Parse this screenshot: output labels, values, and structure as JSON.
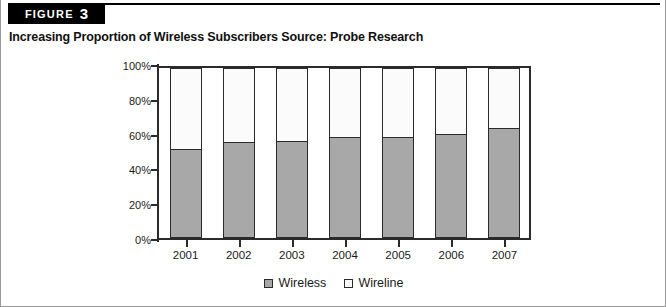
{
  "figure": {
    "banner_label": "FIGURE",
    "banner_number": "3",
    "title": "Increasing Proportion of Wireless Subscribers Source: Probe Research"
  },
  "legend": {
    "items": [
      {
        "label": "Wireless",
        "color": "#a8a8a8"
      },
      {
        "label": "Wireline",
        "color": "#fbfbfb"
      }
    ]
  },
  "axis": {
    "y_ticks": [
      "0%",
      "20%",
      "40%",
      "60%",
      "80%",
      "100%"
    ]
  },
  "chart_data": {
    "type": "bar",
    "stacked": true,
    "stack_total": 100,
    "title": "Increasing Proportion of Wireless Subscribers Source: Probe Research",
    "xlabel": "",
    "ylabel": "",
    "ylim": [
      0,
      100
    ],
    "ytick_values": [
      0,
      20,
      40,
      60,
      80,
      100
    ],
    "ytick_labels": [
      "0%",
      "20%",
      "40%",
      "60%",
      "80%",
      "100%"
    ],
    "grid": false,
    "legend_position": "bottom",
    "categories": [
      "2001",
      "2002",
      "2003",
      "2004",
      "2005",
      "2006",
      "2007"
    ],
    "series": [
      {
        "name": "Wireless",
        "color": "#a8a8a8",
        "values": [
          51,
          55,
          56,
          58,
          58,
          60,
          63
        ]
      },
      {
        "name": "Wireline",
        "color": "#fbfbfb",
        "values": [
          49,
          45,
          44,
          42,
          42,
          40,
          37
        ]
      }
    ]
  }
}
